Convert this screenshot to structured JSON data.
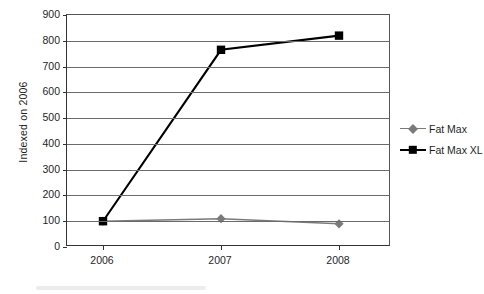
{
  "chart_data": {
    "type": "line",
    "title": "",
    "xlabel": "",
    "ylabel": "Indexed on 2006",
    "categories": [
      "2006",
      "2007",
      "2008"
    ],
    "ylim": [
      0,
      900
    ],
    "ytick_step": 100,
    "yticks": [
      "900",
      "800",
      "700",
      "600",
      "500",
      "400",
      "300",
      "200",
      "100",
      "0"
    ],
    "grid": "horizontal",
    "legend_position": "right",
    "series": [
      {
        "name": "Fat Max",
        "values": [
          100,
          110,
          90
        ],
        "color": "#7a7a7a",
        "marker": "diamond"
      },
      {
        "name": "Fat Max XL",
        "values": [
          100,
          765,
          820
        ],
        "color": "#000000",
        "marker": "square"
      }
    ]
  },
  "legend": {
    "items": [
      {
        "label": "Fat Max",
        "marker": "diamond-marker",
        "color": "#7a7a7a"
      },
      {
        "label": "Fat Max XL",
        "marker": "square-marker",
        "color": "#000000"
      }
    ]
  }
}
